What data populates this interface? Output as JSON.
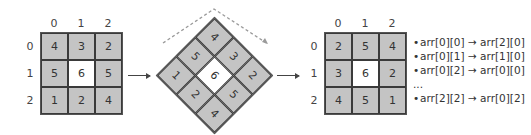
{
  "original_grid": {
    "col_labels": [
      "0",
      "1",
      "2"
    ],
    "row_labels": [
      "0",
      "1",
      "2"
    ],
    "cells": [
      [
        "4",
        "3",
        "2"
      ],
      [
        "5",
        "6",
        "5"
      ],
      [
        "1",
        "2",
        "4"
      ]
    ]
  },
  "rotated_grid": {
    "rotation": "45deg clockwise",
    "cells": [
      [
        "4",
        "3",
        "2"
      ],
      [
        "5",
        "6",
        "5"
      ],
      [
        "1",
        "2",
        "4"
      ]
    ]
  },
  "result_grid": {
    "col_labels": [
      "0",
      "1",
      "2"
    ],
    "row_labels": [
      "0",
      "1",
      "2"
    ],
    "cells": [
      [
        "2",
        "5",
        "4"
      ],
      [
        "3",
        "6",
        "2"
      ],
      [
        "4",
        "5",
        "1"
      ]
    ]
  },
  "mapping_list": [
    {
      "bullet": "•",
      "text": "arr[0][0] → arr[2][0]"
    },
    {
      "bullet": "•",
      "text": "arr[0][1] → arr[1][0]"
    },
    {
      "bullet": "•",
      "text": "arr[0][2] → arr[0][0]"
    },
    {
      "bullet": "",
      "text": "..."
    },
    {
      "bullet": "•",
      "text": "arr[2][2] → arr[0][2]"
    }
  ],
  "colors": {
    "cell_fill": "#c4c4c4",
    "center_fill": "#ffffff",
    "border": "#3a3a3a",
    "text": "#333333",
    "dashed_arrow": "#9a9a9a"
  }
}
